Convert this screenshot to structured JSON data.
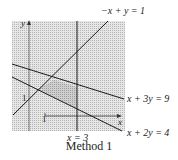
{
  "diagram": {
    "caption": "Method 1",
    "axes": {
      "x_label": "x",
      "y_label": "y",
      "x_tick": "1",
      "y_tick": "1"
    },
    "lines": [
      {
        "id": "l1",
        "equation": "−x + y = 1"
      },
      {
        "id": "l2",
        "equation": "x + 3y = 9"
      },
      {
        "id": "l3",
        "equation": "x + 2y = 4"
      },
      {
        "id": "l4",
        "equation": "x = 3"
      }
    ],
    "colors": {
      "shade_light": "#d9d9d9",
      "shade_dark": "#bdbdbd",
      "line": "#1a1a1a"
    }
  }
}
